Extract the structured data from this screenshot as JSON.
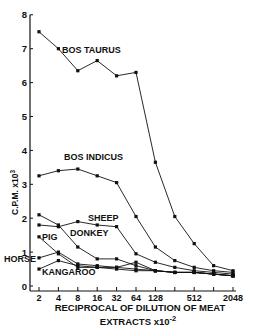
{
  "chart_data": {
    "type": "line",
    "title": "",
    "xlabel": "RECIPROCAL OF DILUTION OF MEAT EXTRACTS x10^-2",
    "xlabel_line1": "RECIPROCAL  OF  DILUTION  OF  MEAT",
    "xlabel_line2": "EXTRACTS  x10",
    "xlabel_exp": "-2",
    "ylabel": "C.P.M. x10^3",
    "ylabel_text": "C.P.M.  x10",
    "ylabel_exp": "3",
    "x_scale": "log2",
    "x": [
      2,
      4,
      8,
      16,
      32,
      64,
      128,
      256,
      512,
      1024,
      2048
    ],
    "x_tick_labels": [
      "2",
      "4",
      "8",
      "16",
      "32",
      "64",
      "128",
      "",
      "512",
      "",
      "2048"
    ],
    "y_ticks": [
      0,
      1,
      2,
      3,
      4,
      5,
      6,
      7,
      8
    ],
    "ylim": [
      0,
      8
    ],
    "grid": false,
    "legend": "inline labels",
    "series": [
      {
        "name": "BOS TAURUS",
        "values": [
          7.5,
          7.0,
          6.35,
          6.65,
          6.2,
          6.3,
          3.65,
          2.05,
          1.25,
          0.6,
          0.45
        ],
        "label_pos": [
          62,
          53
        ]
      },
      {
        "name": "BOS INDICUS",
        "values": [
          3.25,
          3.4,
          3.45,
          3.25,
          3.05,
          2.05,
          1.15,
          0.75,
          0.55,
          0.45,
          0.4
        ],
        "label_pos": [
          64,
          160
        ]
      },
      {
        "name": "SHEEP",
        "values": [
          1.8,
          1.75,
          1.9,
          1.8,
          1.75,
          0.95,
          0.7,
          0.55,
          0.45,
          0.4,
          0.35
        ],
        "label_pos": [
          88,
          221
        ]
      },
      {
        "name": "DONKEY",
        "values": [
          2.1,
          1.8,
          1.15,
          0.8,
          0.8,
          0.6,
          0.45,
          0.4,
          0.4,
          0.35,
          0.3
        ],
        "label_pos": [
          70,
          236
        ]
      },
      {
        "name": "PIG",
        "values": [
          1.45,
          0.95,
          0.55,
          0.55,
          0.5,
          0.45,
          0.45,
          0.4,
          0.4,
          0.35,
          0.3
        ],
        "label_pos": [
          42,
          240
        ]
      },
      {
        "name": "HORSE",
        "values": [
          0.83,
          1.0,
          0.65,
          0.6,
          0.55,
          0.7,
          0.45,
          0.4,
          0.4,
          0.35,
          0.3
        ],
        "label_pos": [
          4,
          262
        ]
      },
      {
        "name": "KANGAROO",
        "values": [
          0.5,
          0.75,
          0.6,
          0.55,
          0.55,
          0.5,
          0.45,
          0.4,
          0.4,
          0.35,
          0.3
        ],
        "label_pos": [
          42,
          275
        ]
      }
    ]
  }
}
